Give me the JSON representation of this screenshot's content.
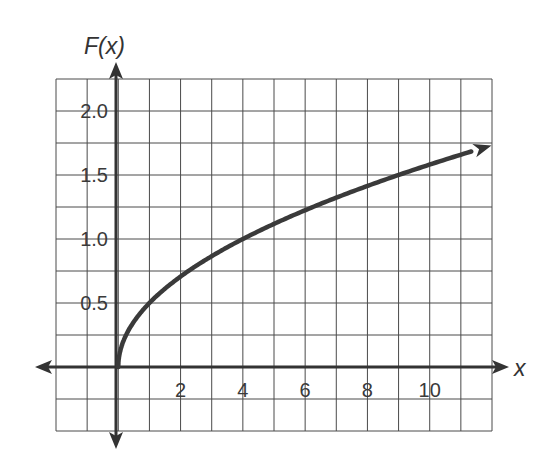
{
  "chart_data": {
    "type": "line",
    "title": "",
    "function": "F(x) = sqrt(x) / 2",
    "xlabel": "x",
    "ylabel": "F(x)",
    "xlim": [
      -2,
      12
    ],
    "ylim": [
      -0.5,
      2.25
    ],
    "grid": true,
    "grid_step_x": 1,
    "grid_step_y": 0.25,
    "x_ticks": [
      2,
      4,
      6,
      8,
      10
    ],
    "x_tick_labels": [
      "2",
      "4",
      "6",
      "8",
      "10"
    ],
    "y_ticks": [
      0.5,
      1.0,
      1.5,
      2.0
    ],
    "y_tick_labels": [
      "0.5",
      "1.0",
      "1.5",
      "2.0"
    ],
    "legend": null,
    "series": [
      {
        "name": "F(x)",
        "x": [
          0,
          0.25,
          1,
          2,
          4,
          6,
          8,
          9,
          10,
          11.8
        ],
        "y": [
          0,
          0.25,
          0.5,
          0.71,
          1.0,
          1.22,
          1.41,
          1.5,
          1.58,
          1.72
        ],
        "end_arrow": true
      }
    ],
    "colors": {
      "curve": "#3a3a3a",
      "axes": "#333333",
      "grid": "#4a4a4a"
    }
  }
}
